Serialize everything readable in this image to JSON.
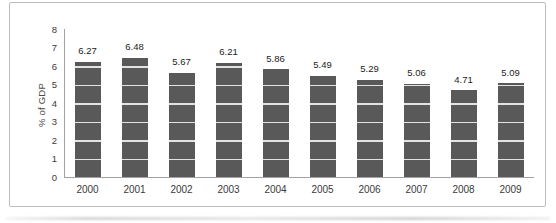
{
  "chart_data": {
    "type": "bar",
    "title": "",
    "xlabel": "",
    "ylabel": "% of GDP",
    "categories": [
      "2000",
      "2001",
      "2002",
      "2003",
      "2004",
      "2005",
      "2006",
      "2007",
      "2008",
      "2009"
    ],
    "values": [
      6.27,
      6.48,
      5.67,
      6.21,
      5.86,
      5.49,
      5.29,
      5.06,
      4.71,
      5.09
    ],
    "value_labels": [
      "6.27",
      "6.48",
      "5.67",
      "6.21",
      "5.86",
      "5.49",
      "5.29",
      "5.06",
      "4.71",
      "5.09"
    ],
    "ylim": [
      0,
      8
    ],
    "yticks": [
      0,
      1,
      2,
      3,
      4,
      5,
      6,
      7,
      8
    ],
    "legend": "none",
    "grid": "horizontal gridlines visible as light lines crossing the bars only",
    "colors": {
      "bar": "#595959",
      "gridline_over_bar": "#e3e3e3",
      "axis_line": "#a3a3a3",
      "tick_label": "#3a3a3a",
      "value_label": "#1c1c1c",
      "frame_border": "#bdbdbd",
      "background": "#ffffff"
    }
  }
}
